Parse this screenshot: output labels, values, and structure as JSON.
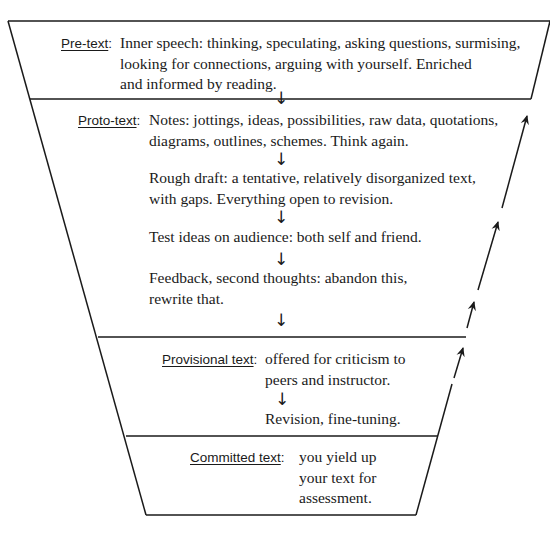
{
  "diagram": {
    "stages": [
      {
        "label": "Pre-text",
        "colon": ":",
        "lines": [
          "Inner speech: thinking, speculating, asking questions, surmising,",
          "looking for connections, arguing with yourself. Enriched",
          "and informed by reading."
        ]
      },
      {
        "label": "Proto-text",
        "colon": ":",
        "steps": [
          {
            "lines": [
              "Notes: jottings, ideas, possibilities, raw data, quotations,",
              "diagrams, outlines, schemes. Think again."
            ]
          },
          {
            "lines": [
              "Rough draft: a tentative, relatively disorganized text,",
              "with gaps. Everything open to revision."
            ]
          },
          {
            "lines": [
              "Test ideas on audience: both self and friend."
            ]
          },
          {
            "lines": [
              "Feedback, second thoughts: abandon this,",
              "rewrite that."
            ]
          }
        ]
      },
      {
        "label": "Provisional text",
        "colon": ":",
        "lines": [
          "offered for criticism to",
          "peers and instructor."
        ],
        "followup": "Revision, fine-tuning."
      },
      {
        "label": "Committed text",
        "colon": ":",
        "lines": [
          "you yield up",
          "your text for",
          "assessment."
        ]
      }
    ],
    "down_arrow_glyph": "↓",
    "stroke_color": "#1a1a1a"
  }
}
